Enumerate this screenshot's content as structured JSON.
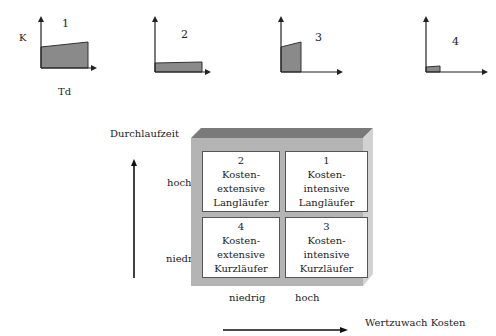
{
  "mini_charts": [
    {
      "id": "1",
      "label": "1",
      "y_axis_label": "K",
      "x_axis_label": "Td"
    },
    {
      "id": "2",
      "label": "2"
    },
    {
      "id": "3",
      "label": "3"
    },
    {
      "id": "4",
      "label": "4"
    }
  ],
  "matrix": {
    "y_axis_title": "Durchlaufzeit",
    "x_axis_title": "Wertzuwach Kosten",
    "y_levels": {
      "high": "hoch",
      "low": "niedrig"
    },
    "x_levels": {
      "low": "niedrig",
      "high": "hoch"
    },
    "cells": [
      {
        "number": "2",
        "line1": "Kosten-",
        "line2": "extensive",
        "line3": "Langläufer"
      },
      {
        "number": "1",
        "line1": "Kosten-",
        "line2": "intensive",
        "line3": "Langläufer"
      },
      {
        "number": "4",
        "line1": "Kosten-",
        "line2": "extensive",
        "line3": "Kurzläufer"
      },
      {
        "number": "3",
        "line1": "Kosten-",
        "line2": "intensive",
        "line3": "Kurzläufer"
      }
    ]
  },
  "colors": {
    "fill": "#8a8a8a",
    "frame": "#b4b4b4",
    "frame_top": "#7a7a7a",
    "frame_side": "#d0d0d0"
  }
}
